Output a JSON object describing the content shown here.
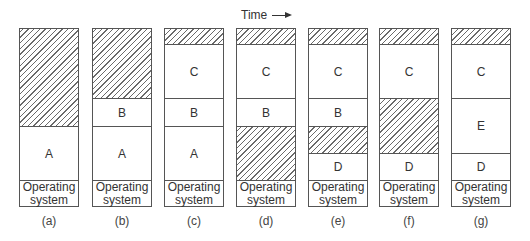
{
  "header": {
    "time_label": "Time",
    "arrow": "right-arrow"
  },
  "colors": {
    "border": "#555555",
    "hatch": "#6a6a6a",
    "background": "#ffffff"
  },
  "columns": [
    {
      "caption": "(a)",
      "blocks": [
        {
          "label": "",
          "type": "hole"
        },
        {
          "label": "A",
          "type": "process"
        },
        {
          "label": "Operating system",
          "type": "os"
        }
      ]
    },
    {
      "caption": "(b)",
      "blocks": [
        {
          "label": "",
          "type": "hole"
        },
        {
          "label": "B",
          "type": "process"
        },
        {
          "label": "A",
          "type": "process"
        },
        {
          "label": "Operating system",
          "type": "os"
        }
      ]
    },
    {
      "caption": "(c)",
      "blocks": [
        {
          "label": "",
          "type": "hole"
        },
        {
          "label": "C",
          "type": "process"
        },
        {
          "label": "B",
          "type": "process"
        },
        {
          "label": "A",
          "type": "process"
        },
        {
          "label": "Operating system",
          "type": "os"
        }
      ]
    },
    {
      "caption": "(d)",
      "blocks": [
        {
          "label": "",
          "type": "hole"
        },
        {
          "label": "C",
          "type": "process"
        },
        {
          "label": "B",
          "type": "process"
        },
        {
          "label": "",
          "type": "hole"
        },
        {
          "label": "Operating system",
          "type": "os"
        }
      ]
    },
    {
      "caption": "(e)",
      "blocks": [
        {
          "label": "",
          "type": "hole"
        },
        {
          "label": "C",
          "type": "process"
        },
        {
          "label": "B",
          "type": "process"
        },
        {
          "label": "",
          "type": "hole"
        },
        {
          "label": "D",
          "type": "process"
        },
        {
          "label": "Operating system",
          "type": "os"
        }
      ]
    },
    {
      "caption": "(f)",
      "blocks": [
        {
          "label": "",
          "type": "hole"
        },
        {
          "label": "C",
          "type": "process"
        },
        {
          "label": "",
          "type": "hole"
        },
        {
          "label": "D",
          "type": "process"
        },
        {
          "label": "Operating system",
          "type": "os"
        }
      ]
    },
    {
      "caption": "(g)",
      "blocks": [
        {
          "label": "",
          "type": "hole"
        },
        {
          "label": "C",
          "type": "process"
        },
        {
          "label": "E",
          "type": "process"
        },
        {
          "label": "D",
          "type": "process"
        },
        {
          "label": "Operating system",
          "type": "os"
        }
      ]
    }
  ],
  "os_label": {
    "line1": "Operating",
    "line2": "system"
  }
}
